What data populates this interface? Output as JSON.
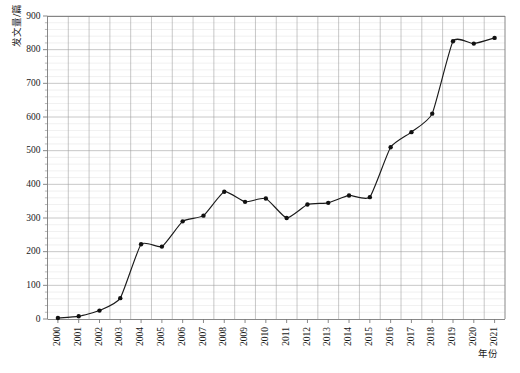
{
  "chart_data": {
    "type": "line",
    "title": "",
    "xlabel": "年份",
    "ylabel": "发文量/篇",
    "categories": [
      "2000",
      "2001",
      "2002",
      "2003",
      "2004",
      "2005",
      "2006",
      "2007",
      "2008",
      "2009",
      "2010",
      "2011",
      "2012",
      "2013",
      "2014",
      "2015",
      "2016",
      "2017",
      "2018",
      "2019",
      "2020",
      "2021"
    ],
    "values": [
      3,
      8,
      25,
      62,
      222,
      215,
      290,
      307,
      378,
      348,
      358,
      300,
      340,
      345,
      367,
      362,
      510,
      555,
      610,
      825,
      818,
      835
    ],
    "series": [
      {
        "name": "发文量",
        "values": [
          3,
          8,
          25,
          62,
          222,
          215,
          290,
          307,
          378,
          348,
          358,
          300,
          340,
          345,
          367,
          362,
          510,
          555,
          610,
          825,
          818,
          835
        ]
      }
    ],
    "ylim": [
      0,
      900
    ],
    "ytick_values": [
      0,
      100,
      200,
      300,
      400,
      500,
      600,
      700,
      800,
      900
    ],
    "ytick_labels": [
      "0",
      "100",
      "200",
      "300",
      "400",
      "500",
      "600",
      "700",
      "800",
      "900"
    ],
    "yminor_step": 20,
    "xtick_labels": [
      "2000",
      "2001",
      "2002",
      "2003",
      "2004",
      "2005",
      "2006",
      "2007",
      "2008",
      "2009",
      "2010",
      "2011",
      "2012",
      "2013",
      "2014",
      "2015",
      "2016",
      "2017",
      "2018",
      "2019",
      "2020",
      "2021"
    ],
    "xtick_rotation": 90,
    "grid": true,
    "grid_major_color": "#9a9a9a",
    "grid_minor_color": "#d8d8d8",
    "legend": false,
    "legend_position": "none",
    "line_color": "#1a1a1a",
    "marker": "circle",
    "marker_color": "#111111",
    "background_color": "#ffffff"
  },
  "axes": {
    "y_title": "发文量/篇",
    "x_title": "年份"
  }
}
